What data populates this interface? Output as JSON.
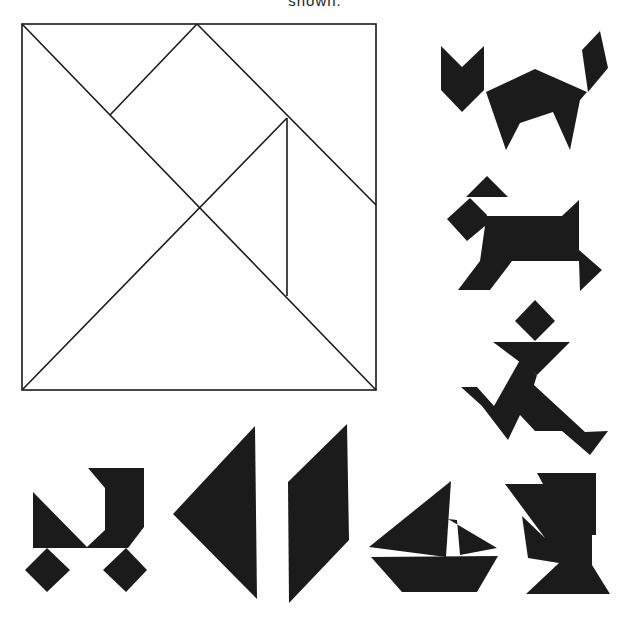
{
  "caption": {
    "text": "shown."
  },
  "colors": {
    "ink": "#1b1b1b",
    "background": "#ffffff",
    "outline": "#1a1a1a"
  },
  "tangram_square": {
    "label": "tangram-square-dissection",
    "frame": {
      "x": 22,
      "y": 24,
      "width": 354,
      "height": 366
    },
    "pieces": [
      "large-triangle-left",
      "large-triangle-bottom",
      "medium-triangle-top-right",
      "small-triangle-center-right",
      "small-triangle-top-left",
      "square",
      "parallelogram"
    ]
  },
  "silhouettes": [
    {
      "name": "cat"
    },
    {
      "name": "dog"
    },
    {
      "name": "running-man"
    },
    {
      "name": "stroller"
    },
    {
      "name": "triangle"
    },
    {
      "name": "parallelogram"
    },
    {
      "name": "sailboat"
    },
    {
      "name": "figure"
    }
  ]
}
